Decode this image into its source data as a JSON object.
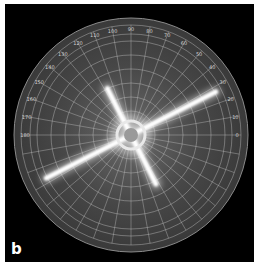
{
  "figure": {
    "panel_label": "b",
    "angle_labels": [
      "0",
      "10",
      "20",
      "30",
      "40",
      "50",
      "60",
      "70",
      "80",
      "90",
      "100",
      "110",
      "120",
      "130",
      "140",
      "150",
      "160",
      "170",
      "180"
    ],
    "angle_range_deg": [
      0,
      180
    ],
    "angle_label_step_deg": 10,
    "streaks": [
      {
        "name": "long-streak",
        "angle_deg": 27
      },
      {
        "name": "short-streak",
        "angle_deg": 117
      }
    ],
    "colors": {
      "background": "#000000",
      "disc": "#3a3a3a",
      "grid": "#bdbdbd",
      "streak": "#ffffff"
    }
  }
}
